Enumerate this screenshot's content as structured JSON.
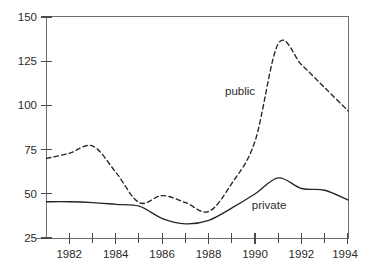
{
  "chart_data": {
    "type": "line",
    "title": "",
    "subtitle": "",
    "xlabel": "",
    "ylabel": "",
    "xlim": [
      1981.0,
      1994.0
    ],
    "ylim": [
      25,
      150
    ],
    "grid": false,
    "legend_position": "inline-annotation",
    "x_ticks_major": [
      1982,
      1984,
      1986,
      1988,
      1990,
      1992,
      1994
    ],
    "x_ticks_minor": [
      1983,
      1985,
      1987,
      1989,
      1991,
      1993
    ],
    "y_ticks": [
      25,
      50,
      75,
      100,
      125,
      150
    ],
    "x_tick_labels": [
      "1982",
      "1984",
      "1986",
      "1988",
      "1990",
      "1992",
      "1994"
    ],
    "y_tick_labels": [
      "25",
      "50",
      "75",
      "100",
      "125",
      "150"
    ],
    "annotations": [
      {
        "text": "public",
        "x": 1989.35,
        "y": 108
      },
      {
        "text": "private",
        "x": 1990.6,
        "y": 43.5
      }
    ],
    "series": [
      {
        "name": "public",
        "style": "dashed",
        "color": "#262626",
        "x": [
          1981.0,
          1982.0,
          1983.0,
          1984.0,
          1985.0,
          1986.0,
          1987.0,
          1988.0,
          1989.0,
          1990.0,
          1991.0,
          1992.0,
          1993.0,
          1994.0
        ],
        "values": [
          70,
          73,
          77,
          62,
          45,
          49,
          45,
          40,
          56,
          80,
          135,
          123,
          110,
          97
        ]
      },
      {
        "name": "private",
        "style": "solid",
        "color": "#262626",
        "x": [
          1981.0,
          1982.0,
          1983.0,
          1984.0,
          1985.0,
          1986.0,
          1987.0,
          1988.0,
          1989.0,
          1990.0,
          1991.0,
          1992.0,
          1993.0,
          1994.0
        ],
        "values": [
          45.5,
          45.5,
          45,
          44,
          43,
          36,
          33,
          35,
          42,
          50,
          59,
          53,
          52,
          46.5
        ]
      }
    ]
  },
  "caption": {
    "text": ""
  }
}
